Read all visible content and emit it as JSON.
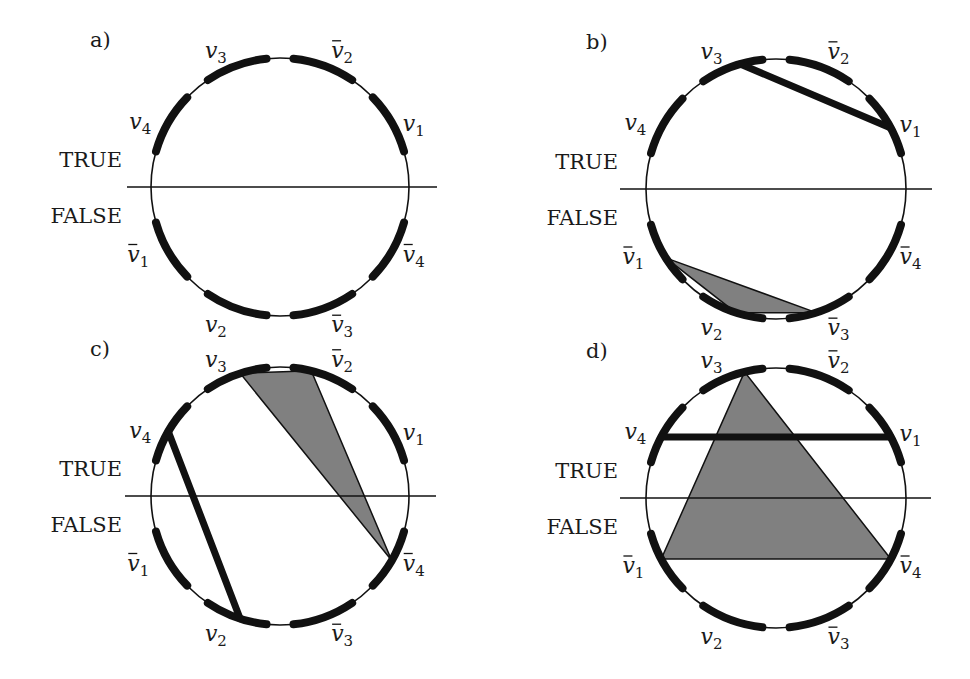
{
  "figure": {
    "side_labels": {
      "true": "TRUE",
      "false": "FALSE"
    },
    "colors": {
      "ink": "#111111",
      "fill": "#808080",
      "background": "#ffffff"
    },
    "arc_angles_deg": {
      "v3": 110,
      "v2bar": 70,
      "v1": 30,
      "v4": 150,
      "v1bar": 210,
      "v4bar": 330,
      "v2": 250,
      "v3bar": 290
    },
    "panels": [
      {
        "id": "a",
        "label": "a)",
        "cx": 280,
        "cy": 187,
        "r": 129,
        "line_x1": 127,
        "line_x2": 437,
        "edges": [],
        "triangles": []
      },
      {
        "id": "b",
        "label": "b)",
        "cx": 776,
        "cy": 189,
        "r": 130,
        "line_x1": 620,
        "line_x2": 932,
        "edges": [
          {
            "from": "v3",
            "to": "v1",
            "from_deg": 106,
            "to_deg": 28
          }
        ],
        "triangles": [
          {
            "points_deg": [
              212,
              252,
              288
            ],
            "flat_base": true
          }
        ]
      },
      {
        "id": "c",
        "label": "c)",
        "cx": 280,
        "cy": 496,
        "r": 129,
        "line_x1": 125,
        "line_x2": 436,
        "edges": [
          {
            "from": "v4",
            "to": "v2",
            "from_deg": 150,
            "to_deg": 252
          }
        ],
        "triangles": [
          {
            "points_deg": [
              108,
              76,
              330
            ]
          }
        ]
      },
      {
        "id": "d",
        "label": "d)",
        "cx": 776,
        "cy": 498,
        "r": 130,
        "line_x1": 620,
        "line_x2": 931,
        "edges": [
          {
            "from": "v4",
            "to": "v1",
            "from_deg": 152,
            "to_deg": 28
          }
        ],
        "triangles": [
          {
            "points_deg": [
              104,
              208,
              332
            ]
          }
        ]
      }
    ],
    "variables": [
      {
        "key": "v3",
        "base": "v",
        "sub": "3",
        "bar": false,
        "angle": 110,
        "dx": -20,
        "dy": -8
      },
      {
        "key": "v2bar",
        "base": "v",
        "sub": "2",
        "bar": true,
        "angle": 70,
        "dx": 18,
        "dy": -8
      },
      {
        "key": "v1",
        "base": "v",
        "sub": "1",
        "bar": false,
        "angle": 30,
        "dx": 22,
        "dy": 8
      },
      {
        "key": "v4",
        "base": "v",
        "sub": "4",
        "bar": false,
        "angle": 150,
        "dx": -28,
        "dy": 6
      },
      {
        "key": "v1bar",
        "base": "v",
        "sub": "1",
        "bar": true,
        "angle": 210,
        "dx": -30,
        "dy": 10
      },
      {
        "key": "v4bar",
        "base": "v",
        "sub": "4",
        "bar": true,
        "angle": 330,
        "dx": 22,
        "dy": 10
      },
      {
        "key": "v2",
        "base": "v",
        "sub": "2",
        "bar": false,
        "angle": 250,
        "dx": -20,
        "dy": 24
      },
      {
        "key": "v3bar",
        "base": "v",
        "sub": "3",
        "bar": true,
        "angle": 290,
        "dx": 18,
        "dy": 24
      }
    ]
  }
}
